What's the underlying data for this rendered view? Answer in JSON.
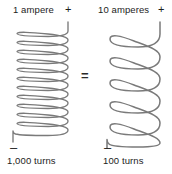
{
  "diagram": {
    "relation_symbol": "=",
    "line_color": "#7a7a7a",
    "text_color": "#1c1c1c",
    "background_color": "#ffffff",
    "left_coil": {
      "current_label": "1 ampere",
      "positive_terminal": "+",
      "negative_terminal": "–",
      "turns_label": "1,000 turns",
      "turns": 1000,
      "current_amperes": 1,
      "ampere_turns": 1000,
      "drawn_loops": 18,
      "winding": "dense"
    },
    "right_coil": {
      "current_label": "10 amperes",
      "positive_terminal": "+",
      "negative_terminal": "–",
      "turns_label": "100 turns",
      "turns": 100,
      "current_amperes": 10,
      "ampere_turns": 1000,
      "drawn_loops": 6,
      "winding": "loose"
    }
  }
}
